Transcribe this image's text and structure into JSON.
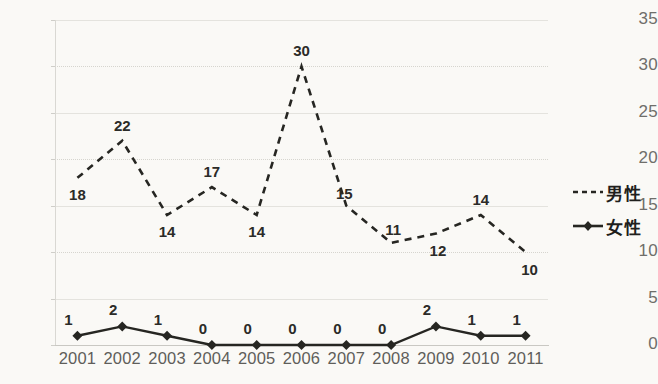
{
  "chart_data": {
    "type": "line",
    "title": "",
    "subtitle": "",
    "xlabel": "",
    "ylabel": "",
    "categories": [
      "2001",
      "2002",
      "2003",
      "2004",
      "2005",
      "2006",
      "2007",
      "2008",
      "2009",
      "2010",
      "2011"
    ],
    "series": [
      {
        "name": "男性",
        "style": "dashed",
        "marker": "none",
        "color": "#262622",
        "values": [
          18,
          22,
          14,
          17,
          14,
          30,
          15,
          11,
          12,
          14,
          10
        ]
      },
      {
        "name": "女性",
        "style": "solid",
        "marker": "diamond",
        "color": "#262622",
        "values": [
          1,
          2,
          1,
          0,
          0,
          0,
          0,
          0,
          2,
          1,
          1
        ]
      }
    ],
    "ylim": [
      0,
      35
    ],
    "ytick_values": [
      "0",
      "5",
      "10",
      "15",
      "20",
      "25",
      "30",
      "35"
    ],
    "grid": true,
    "legend_position": "right",
    "data_labels": true
  },
  "legend": {
    "items": [
      {
        "label": "男性",
        "swatch": "dashed-line"
      },
      {
        "label": "女性",
        "swatch": "solid-line-diamond"
      }
    ]
  },
  "colors": {
    "background": "#faf9f6",
    "gridline": "#e4e3de",
    "axis": "#c9c8c3",
    "tick_text": "#6f6e6a",
    "series": "#262622"
  }
}
